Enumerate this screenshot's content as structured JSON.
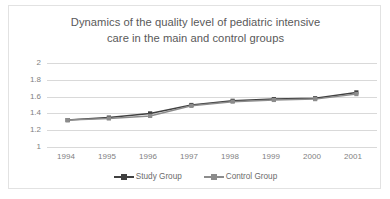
{
  "chart_data": {
    "type": "line",
    "title": "Dynamics of the quality level of pediatric intensive care in the main and control groups",
    "title_line1": "Dynamics of the quality level of pediatric intensive",
    "title_line2": "care in the main and control groups",
    "xlabel": "",
    "ylabel": "",
    "categories": [
      "1994",
      "1995",
      "1996",
      "1997",
      "1998",
      "1999",
      "2000",
      "2001"
    ],
    "yticks": [
      "1",
      "1.2",
      "1.4",
      "1.6",
      "1.8",
      "2"
    ],
    "ylim": [
      1,
      2
    ],
    "grid": true,
    "legend_position": "bottom",
    "series": [
      {
        "name": "Study Group",
        "color": "#404040",
        "values": [
          1.32,
          1.35,
          1.4,
          1.5,
          1.55,
          1.57,
          1.58,
          1.65
        ]
      },
      {
        "name": "Control Group",
        "color": "#8c8c8c",
        "values": [
          1.32,
          1.34,
          1.37,
          1.49,
          1.54,
          1.56,
          1.57,
          1.63
        ]
      }
    ]
  },
  "colors": {
    "study_group": "#404040",
    "control_group": "#8c8c8c",
    "gridline": "#d9d9d9",
    "tick_label": "#7f7f7f",
    "title_text": "#595959",
    "card_border": "#e2e2e2",
    "background": "#ffffff"
  }
}
